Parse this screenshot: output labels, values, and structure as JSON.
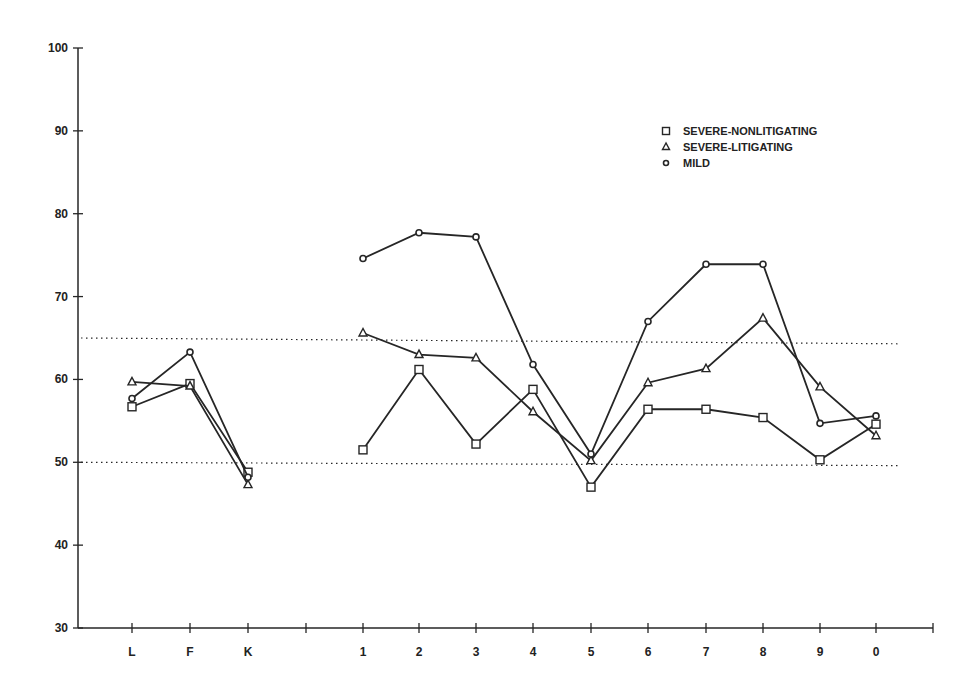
{
  "chart_data": {
    "type": "line",
    "title": "",
    "xlabel": "",
    "ylabel": "",
    "ylim": [
      30,
      100
    ],
    "yticks": [
      30,
      40,
      50,
      60,
      70,
      80,
      90,
      100
    ],
    "grid": false,
    "legend_position": "upper right",
    "categories": [
      "L",
      "F",
      "K",
      "",
      "1",
      "2",
      "3",
      "4",
      "5",
      "6",
      "7",
      "8",
      "9",
      "0"
    ],
    "reference_lines": [
      {
        "name": "upper-reference",
        "value_left": 65,
        "value_right": 64.3,
        "style": "dotted"
      },
      {
        "name": "lower-reference",
        "value_left": 50,
        "value_right": 49.6,
        "style": "dotted"
      }
    ],
    "segments_note": "Lines are broken between K and 1 (validity scales L,F,K vs clinical scales 1-0)",
    "series": [
      {
        "name": "SEVERE-NONLITIGATING",
        "marker": "square",
        "values": [
          56.7,
          59.5,
          48.8,
          null,
          51.5,
          61.2,
          52.2,
          58.8,
          47.0,
          56.4,
          56.4,
          55.4,
          50.3,
          54.6
        ]
      },
      {
        "name": "SEVERE-LITIGATING",
        "marker": "triangle",
        "values": [
          59.7,
          59.2,
          47.3,
          null,
          65.6,
          63.0,
          62.6,
          56.1,
          50.2,
          59.6,
          61.3,
          67.4,
          59.1,
          53.2
        ]
      },
      {
        "name": "MILD",
        "marker": "diamond",
        "values": [
          57.7,
          63.3,
          48.2,
          null,
          74.6,
          77.7,
          77.2,
          61.8,
          51.0,
          67.0,
          73.9,
          73.9,
          54.7,
          55.6
        ]
      }
    ]
  },
  "legend": {
    "items": [
      {
        "label": "SEVERE-NONLITIGATING",
        "marker": "square"
      },
      {
        "label": "SEVERE-LITIGATING",
        "marker": "triangle"
      },
      {
        "label": "MILD",
        "marker": "diamond"
      }
    ]
  },
  "colors": {
    "ink": "#262626",
    "background": "#ffffff"
  }
}
